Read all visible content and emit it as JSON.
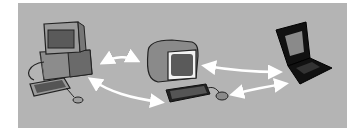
{
  "illustration": {
    "description": "Three computers exchanging data",
    "background_color": "#b4b4b4",
    "devices": [
      {
        "name": "desktop-computer",
        "label": ""
      },
      {
        "name": "terminal-computer",
        "label": ""
      },
      {
        "name": "laptop-computer",
        "label": ""
      }
    ],
    "arrows": [
      {
        "from": "desktop-computer",
        "to": "terminal-computer",
        "type": "bidirectional"
      },
      {
        "from": "desktop-computer",
        "to": "terminal-computer",
        "type": "bidirectional"
      },
      {
        "from": "terminal-computer",
        "to": "laptop-computer",
        "type": "bidirectional"
      },
      {
        "from": "terminal-computer",
        "to": "laptop-computer",
        "type": "bidirectional"
      }
    ]
  }
}
